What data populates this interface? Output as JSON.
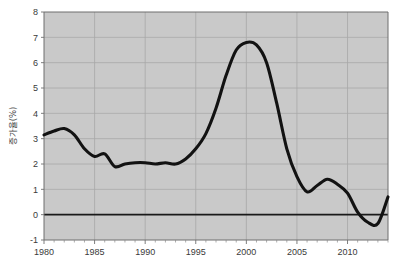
{
  "chart_data": {
    "type": "line",
    "title": "",
    "subtitle": "",
    "xlabel": "",
    "ylabel": "증가율(%)",
    "xlim": [
      1980,
      2014
    ],
    "ylim": [
      -1,
      8
    ],
    "grid": true,
    "legend": "none",
    "zero_line": true,
    "x_ticks": [
      1980,
      1985,
      1990,
      1995,
      2000,
      2005,
      2010
    ],
    "x_tick_labels": [
      "1980",
      "1985",
      "1990",
      "1995",
      "2000",
      "2005",
      "2010"
    ],
    "x_minor_tick_interval": 1,
    "y_ticks": [
      -1,
      0,
      1,
      2,
      3,
      4,
      5,
      6,
      7,
      8
    ],
    "y_tick_labels": [
      "-1",
      "0",
      "1",
      "2",
      "3",
      "4",
      "5",
      "6",
      "7",
      "8"
    ],
    "series": [
      {
        "name": "증가율",
        "color": "#121212",
        "x": [
          1980,
          1981,
          1982,
          1983,
          1984,
          1985,
          1986,
          1987,
          1988,
          1989,
          1990,
          1991,
          1992,
          1993,
          1994,
          1995,
          1996,
          1997,
          1998,
          1999,
          2000,
          2001,
          2002,
          2003,
          2004,
          2005,
          2006,
          2007,
          2008,
          2009,
          2010,
          2011,
          2012,
          2013,
          2014
        ],
        "values": [
          3.15,
          3.3,
          3.4,
          3.15,
          2.6,
          2.3,
          2.4,
          1.9,
          2.0,
          2.05,
          2.05,
          2.0,
          2.05,
          2.0,
          2.2,
          2.6,
          3.2,
          4.2,
          5.5,
          6.5,
          6.8,
          6.7,
          6.0,
          4.4,
          2.6,
          1.5,
          0.9,
          1.15,
          1.4,
          1.2,
          0.85,
          0.1,
          -0.3,
          -0.35,
          0.7
        ]
      }
    ]
  },
  "axis": {
    "y_title": "증가율(%)"
  },
  "footer": {
    "caption": ""
  }
}
